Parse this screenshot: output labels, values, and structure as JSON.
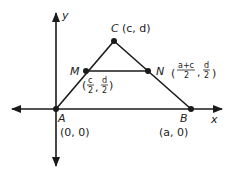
{
  "diagram": {
    "type": "coordinate-geometry",
    "axes": {
      "x_label": "x",
      "y_label": "y"
    },
    "points": {
      "A": {
        "name": "A",
        "coords": "(0, 0)"
      },
      "B": {
        "name": "B",
        "coords": "(a, 0)"
      },
      "C": {
        "name": "C",
        "coords": "(c, d)"
      },
      "M": {
        "name": "M",
        "coords_open": "(",
        "coords_close": ")",
        "x_num": "c",
        "x_den": "2",
        "y_num": "d",
        "y_den": "2"
      },
      "N": {
        "name": "N",
        "coords_open": "(",
        "coords_close": ")",
        "x_num": "a+c",
        "x_den": "2",
        "y_num": "d",
        "y_den": "2"
      }
    },
    "segments": [
      "AC",
      "CB",
      "AB",
      "MN"
    ],
    "colors": {
      "line": "#1a1a1a",
      "text": "#222222",
      "background": "#ffffff"
    }
  }
}
